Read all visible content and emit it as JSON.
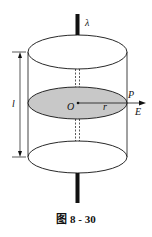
{
  "figure": {
    "caption": "图 8 - 30",
    "labels": {
      "lambda": "λ",
      "length": "l",
      "origin": "O",
      "radius": "r",
      "point": "P",
      "field": "E"
    },
    "colors": {
      "stroke": "#111111",
      "shaded_section": "#c8c8c8",
      "background": "#ffffff"
    }
  }
}
